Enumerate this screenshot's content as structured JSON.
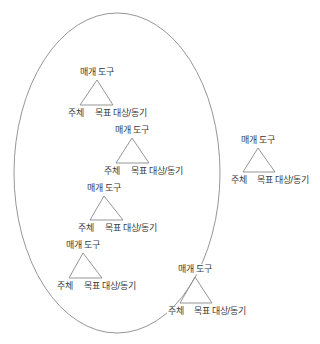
{
  "diagram": {
    "title": "",
    "colors": {
      "line": "#8a8a8a",
      "text": "#3a3a3a",
      "background": "#ffffff"
    },
    "boundary": {
      "shape": "ellipse",
      "cx": 117,
      "cy": 173,
      "rx": 103,
      "ry": 160
    },
    "labels": {
      "tool": "매개 도구",
      "subject": "주체",
      "object": "목표 대상/동기"
    },
    "triangles": [
      {
        "id": "t1",
        "inside": true,
        "apex": [
          97,
          80
        ],
        "base_left": [
          80,
          105
        ],
        "base_right": [
          113,
          105
        ],
        "tool": "매개 도구",
        "subject": "주체",
        "object": "목표 대상/동기"
      },
      {
        "id": "t2",
        "inside": true,
        "apex": [
          132,
          138
        ],
        "base_left": [
          116,
          163
        ],
        "base_right": [
          149,
          163
        ],
        "tool": "매개 도구",
        "subject": "주체",
        "object": "목표 대상/동기"
      },
      {
        "id": "t3",
        "inside": true,
        "apex": [
          104,
          196
        ],
        "base_left": [
          90,
          220
        ],
        "base_right": [
          123,
          220
        ],
        "tool": "매개 도구",
        "subject": "주체",
        "object": "목표 대상/동기"
      },
      {
        "id": "t4",
        "inside": true,
        "apex": [
          83,
          253
        ],
        "base_left": [
          69,
          278
        ],
        "base_right": [
          102,
          278
        ],
        "tool": "매개 도구",
        "subject": "주체",
        "object": "목표 대상/동기"
      },
      {
        "id": "t5",
        "inside": false,
        "on_boundary": true,
        "apex": [
          195,
          277
        ],
        "base_left": [
          180,
          303
        ],
        "base_right": [
          212,
          303
        ],
        "tool": "매개 도구",
        "subject": "주체",
        "object": "목표 대상/동기"
      },
      {
        "id": "t6",
        "inside": false,
        "apex": [
          258,
          148
        ],
        "base_left": [
          243,
          172
        ],
        "base_right": [
          275,
          172
        ],
        "tool": "매개 도구",
        "subject": "주체",
        "object": "목표 대상/동기"
      }
    ]
  }
}
